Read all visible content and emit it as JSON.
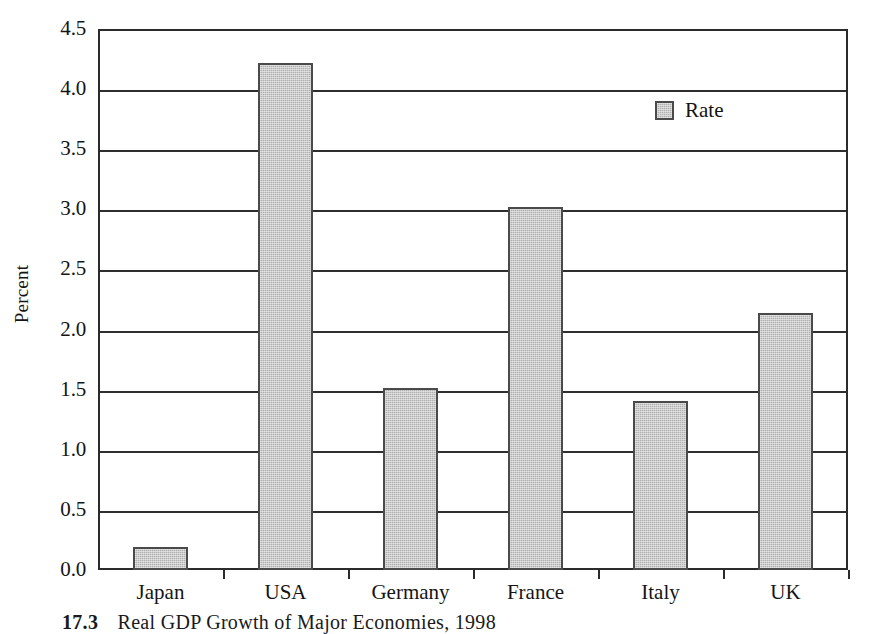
{
  "chart_data": {
    "type": "bar",
    "title": "",
    "subtitle": "",
    "xlabel": "",
    "ylabel": "Percent",
    "categories": [
      "Japan",
      "USA",
      "Germany",
      "France",
      "Italy",
      "UK"
    ],
    "values": [
      0.19,
      4.22,
      1.51,
      3.02,
      1.41,
      2.14
    ],
    "series": [
      {
        "name": "Rate",
        "values": [
          0.19,
          4.22,
          1.51,
          3.02,
          1.41,
          2.14
        ]
      }
    ],
    "ylim": [
      0.0,
      4.5
    ],
    "ytick_values": [
      0.0,
      0.5,
      1.0,
      1.5,
      2.0,
      2.5,
      3.0,
      3.5,
      4.0,
      4.5
    ],
    "ytick_labels": [
      "0.0",
      "0.5",
      "1.0",
      "1.5",
      "2.0",
      "2.5",
      "3.0",
      "3.5",
      "4.0",
      "4.5"
    ],
    "grid": true,
    "grid_axis": "y",
    "legend": {
      "position": "upper-right-inside",
      "entries": [
        {
          "label": "Rate",
          "color": "#b0b0b0"
        }
      ]
    },
    "bar_color": "#b0b0b0",
    "bar_edge_color": "#4a4a4a",
    "axis_color": "#2b2b2b"
  },
  "axis": {
    "y_title": "Percent",
    "y_ticks": [
      {
        "label": "4.5",
        "value": 4.5
      },
      {
        "label": "4.0",
        "value": 4.0
      },
      {
        "label": "3.5",
        "value": 3.5
      },
      {
        "label": "3.0",
        "value": 3.0
      },
      {
        "label": "2.5",
        "value": 2.5
      },
      {
        "label": "2.0",
        "value": 2.0
      },
      {
        "label": "1.5",
        "value": 1.5
      },
      {
        "label": "1.0",
        "value": 1.0
      },
      {
        "label": "0.5",
        "value": 0.5
      },
      {
        "label": "0.0",
        "value": 0.0
      }
    ],
    "x_categories": [
      {
        "label": "Japan"
      },
      {
        "label": "USA"
      },
      {
        "label": "Germany"
      },
      {
        "label": "France"
      },
      {
        "label": "Italy"
      },
      {
        "label": "UK"
      }
    ]
  },
  "legend": {
    "entries": [
      {
        "label": "Rate"
      }
    ]
  },
  "caption": {
    "number": "17.3",
    "text": "Real GDP Growth of Major Economies, 1998",
    "full": "17.3   Real GDP Growth of Major Economies, 1998"
  }
}
